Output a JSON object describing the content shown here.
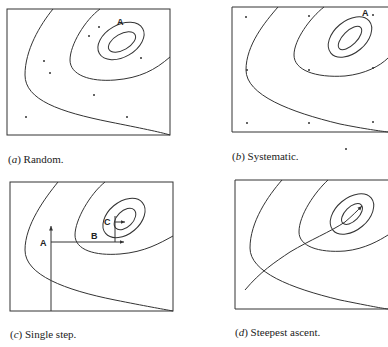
{
  "figure": {
    "panels": [
      {
        "id": "a",
        "letter": "a",
        "caption": "Random.",
        "point_label": "A"
      },
      {
        "id": "b",
        "letter": "b",
        "caption": "Systematic.",
        "point_label": "A"
      },
      {
        "id": "c",
        "letter": "c",
        "caption": "Single step.",
        "step_labels": [
          "A",
          "B",
          "C"
        ]
      },
      {
        "id": "d",
        "letter": "d",
        "caption": "Steepest ascent."
      }
    ]
  }
}
